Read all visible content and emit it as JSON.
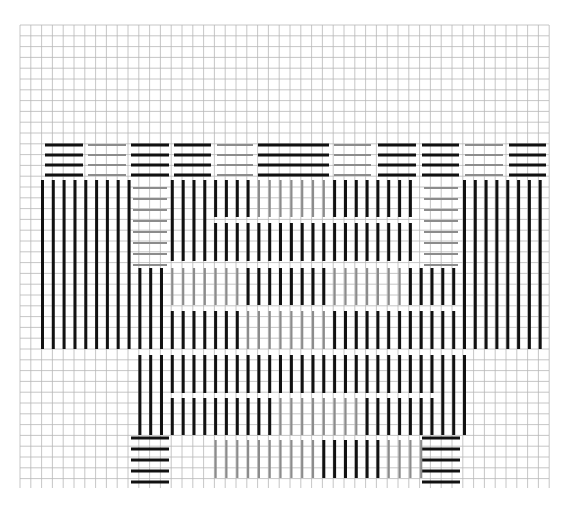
{
  "colors": {
    "paper": "#ffffff",
    "grid": "#b8b8b8",
    "grid_major": "#9a9a9a",
    "dark": "#111111",
    "light": "#8c8c8c"
  },
  "grid": {
    "x0": 20,
    "y0": 25,
    "x1": 549,
    "y1": 488,
    "cell": 10.8
  },
  "columns": {
    "x0": 42.5,
    "step": 10.82
  },
  "top_rows": {
    "y": [
      145,
      155,
      165,
      175
    ],
    "segments": [
      {
        "x1": 45,
        "x2": 83,
        "tone": "dark"
      },
      {
        "x1": 88,
        "x2": 126,
        "tone": "light"
      },
      {
        "x1": 131,
        "x2": 169,
        "tone": "dark"
      },
      {
        "x1": 174,
        "x2": 211,
        "tone": "dark"
      },
      {
        "x1": 217,
        "x2": 253,
        "tone": "light"
      },
      {
        "x1": 258,
        "x2": 329,
        "tone": "dark"
      },
      {
        "x1": 334,
        "x2": 371,
        "tone": "light"
      },
      {
        "x1": 378,
        "x2": 416,
        "tone": "dark"
      },
      {
        "x1": 422,
        "x2": 459,
        "tone": "dark"
      },
      {
        "x1": 465,
        "x2": 503,
        "tone": "light"
      },
      {
        "x1": 509,
        "x2": 546,
        "tone": "dark"
      }
    ]
  },
  "horizontal_boxes": [
    {
      "name": "left-upper-box",
      "x1": 133,
      "x2": 167,
      "y": [
        188,
        199,
        210,
        221,
        232,
        243,
        254,
        265
      ],
      "tone": "light"
    },
    {
      "name": "right-upper-box",
      "x1": 424,
      "x2": 458,
      "y": [
        188,
        199,
        210,
        221,
        232,
        243,
        254,
        265
      ],
      "tone": "light"
    },
    {
      "name": "left-foot",
      "x1": 131,
      "x2": 169,
      "y": [
        438,
        449,
        460,
        471,
        482
      ],
      "tone": "dark"
    },
    {
      "name": "right-foot",
      "x1": 422,
      "x2": 460,
      "y": [
        438,
        449,
        460,
        471,
        482
      ],
      "tone": "dark"
    }
  ],
  "vertical_stitches": [
    {
      "cols": [
        0,
        1,
        2,
        3,
        4,
        5,
        6,
        7,
        8
      ],
      "y1": 180,
      "y2": 349,
      "tone": "dark"
    },
    {
      "cols": [
        39,
        40,
        41,
        42,
        43,
        44,
        45,
        46
      ],
      "y1": 180,
      "y2": 349,
      "tone": "dark"
    },
    {
      "cols": [
        12,
        13,
        14,
        15
      ],
      "y1": 180,
      "y2": 261,
      "tone": "dark"
    },
    {
      "cols": [
        16,
        17,
        18,
        19
      ],
      "y1": 180,
      "y2": 217,
      "tone": "dark"
    },
    {
      "cols": [
        16,
        17,
        18,
        19
      ],
      "y1": 223,
      "y2": 261,
      "tone": "dark"
    },
    {
      "cols": [
        20,
        21,
        22,
        23,
        24,
        25,
        26
      ],
      "y1": 180,
      "y2": 217,
      "tone": "light"
    },
    {
      "cols": [
        20,
        21,
        22,
        23,
        24,
        25,
        26
      ],
      "y1": 223,
      "y2": 261,
      "tone": "dark"
    },
    {
      "cols": [
        27,
        28,
        29,
        30,
        31,
        32,
        33,
        34
      ],
      "y1": 180,
      "y2": 217,
      "tone": "dark"
    },
    {
      "cols": [
        27,
        28,
        29,
        30,
        31,
        32,
        33,
        34
      ],
      "y1": 223,
      "y2": 261,
      "tone": "dark"
    },
    {
      "cols": [
        9,
        10,
        11
      ],
      "y1": 268,
      "y2": 349,
      "tone": "dark"
    },
    {
      "cols": [
        12,
        13,
        14,
        15,
        16,
        17,
        18
      ],
      "y1": 268,
      "y2": 305,
      "tone": "light"
    },
    {
      "cols": [
        12,
        13,
        14,
        15,
        16,
        17,
        18
      ],
      "y1": 311,
      "y2": 349,
      "tone": "dark"
    },
    {
      "cols": [
        19,
        20,
        21,
        22,
        23,
        24,
        25,
        26
      ],
      "y1": 268,
      "y2": 305,
      "tone": "dark"
    },
    {
      "cols": [
        19,
        20,
        21,
        22,
        23,
        24,
        25,
        26
      ],
      "y1": 311,
      "y2": 349,
      "tone": "light"
    },
    {
      "cols": [
        27,
        28,
        29,
        30,
        31,
        32,
        33
      ],
      "y1": 268,
      "y2": 305,
      "tone": "light"
    },
    {
      "cols": [
        27,
        28,
        29,
        30,
        31,
        32,
        33
      ],
      "y1": 311,
      "y2": 349,
      "tone": "dark"
    },
    {
      "cols": [
        34,
        35,
        36,
        37,
        38
      ],
      "y1": 268,
      "y2": 305,
      "tone": "dark"
    },
    {
      "cols": [
        34,
        35,
        36,
        37,
        38
      ],
      "y1": 311,
      "y2": 349,
      "tone": "dark"
    },
    {
      "cols": [
        9,
        10,
        11
      ],
      "y1": 355,
      "y2": 435,
      "tone": "dark"
    },
    {
      "cols": [
        12,
        13,
        14,
        15,
        16,
        17,
        18,
        19,
        20,
        21
      ],
      "y1": 355,
      "y2": 393,
      "tone": "dark"
    },
    {
      "cols": [
        22,
        23,
        24,
        25,
        26,
        27,
        28,
        29,
        30,
        31,
        32,
        33,
        34,
        35,
        36
      ],
      "y1": 355,
      "y2": 393,
      "tone": "dark"
    },
    {
      "cols": [
        12,
        13,
        14,
        15,
        16,
        17,
        18,
        19,
        20,
        21
      ],
      "y1": 398,
      "y2": 435,
      "tone": "dark"
    },
    {
      "cols": [
        22,
        23,
        24,
        25,
        26,
        27,
        28,
        29
      ],
      "y1": 398,
      "y2": 435,
      "tone": "light"
    },
    {
      "cols": [
        30,
        31,
        32,
        33,
        34,
        35,
        36
      ],
      "y1": 398,
      "y2": 435,
      "tone": "dark"
    },
    {
      "cols": [
        37,
        38,
        39
      ],
      "y1": 355,
      "y2": 435,
      "tone": "dark"
    },
    {
      "cols": [
        16,
        17,
        18,
        19,
        20,
        21,
        22,
        23,
        24,
        25
      ],
      "y1": 440,
      "y2": 478,
      "tone": "light"
    },
    {
      "cols": [
        26,
        27,
        28,
        29,
        30,
        31
      ],
      "y1": 440,
      "y2": 478,
      "tone": "dark"
    },
    {
      "cols": [
        32,
        33,
        34,
        35
      ],
      "y1": 440,
      "y2": 478,
      "tone": "light"
    }
  ]
}
